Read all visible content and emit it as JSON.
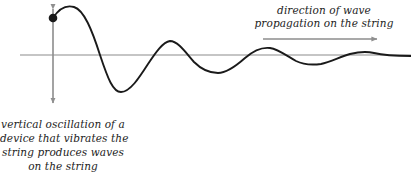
{
  "figure": {
    "background_color": "#ffffff",
    "wave_color": "#1a1a1a",
    "axis_color": "#8c8c8c",
    "text_color": "#1c1c1c",
    "dot_color": "#1a1a1a"
  },
  "annotations": {
    "propagation": {
      "name": "direction-of-wave-propagation-label",
      "line1": "direction of wave",
      "line2": "propagation on the string"
    },
    "oscillation": {
      "name": "vertical-oscillation-caption",
      "line1": "vertical oscillation of a",
      "line2": "device that vibrates the",
      "line3": "string produces waves",
      "line4": "on the string"
    }
  },
  "icons": {
    "propagation_arrow": "right-arrow-icon",
    "oscillation_arrow": "up-down-arrow-icon",
    "source_dot": "source-point-dot-icon",
    "baseline": "equilibrium-axis-line"
  },
  "chart_data": {
    "type": "line",
    "title": "",
    "xlabel": "",
    "ylabel": "",
    "grid": false,
    "legend": null,
    "xlim": [
      20,
      411
    ],
    "ylim": [
      0,
      178
    ],
    "baseline_y": 55,
    "baseline_x_start": 20,
    "baseline_x_end": 411,
    "source_point": {
      "x": 53,
      "y": 18
    },
    "vertical_arrow": {
      "x": 53,
      "y_top": 2,
      "y_bottom": 110
    },
    "propagation_arrow": {
      "x_start": 263,
      "x_end": 383,
      "y": 39
    },
    "wave_path": "M 53 18 C 60 7, 67 5, 74 7 C 84 10, 92 30, 100 55 C 108 79, 113 92, 121 92 C 130 92, 139 78, 148 64 C 156 52, 163 42, 170 41 C 178 41, 186 53, 194 62 C 202 70, 210 73, 218 73 C 226 73, 236 66, 245 58 C 253 51, 262 47, 270 48 C 278 49, 287 56, 296 61 C 304 65, 313 65, 321 64 C 330 62, 340 57, 350 54 C 358 52, 366 51, 374 53 C 382 55, 392 56, 411 56",
    "peaks": [
      {
        "x": 74,
        "y": 7,
        "amplitude": 48
      },
      {
        "x": 170,
        "y": 41,
        "amplitude": 14
      },
      {
        "x": 270,
        "y": 48,
        "amplitude": 7
      },
      {
        "x": 366,
        "y": 51,
        "amplitude": 4
      }
    ],
    "troughs": [
      {
        "x": 121,
        "y": 92,
        "amplitude": -37
      },
      {
        "x": 218,
        "y": 73,
        "amplitude": -18
      },
      {
        "x": 321,
        "y": 64,
        "amplitude": -9
      }
    ]
  }
}
